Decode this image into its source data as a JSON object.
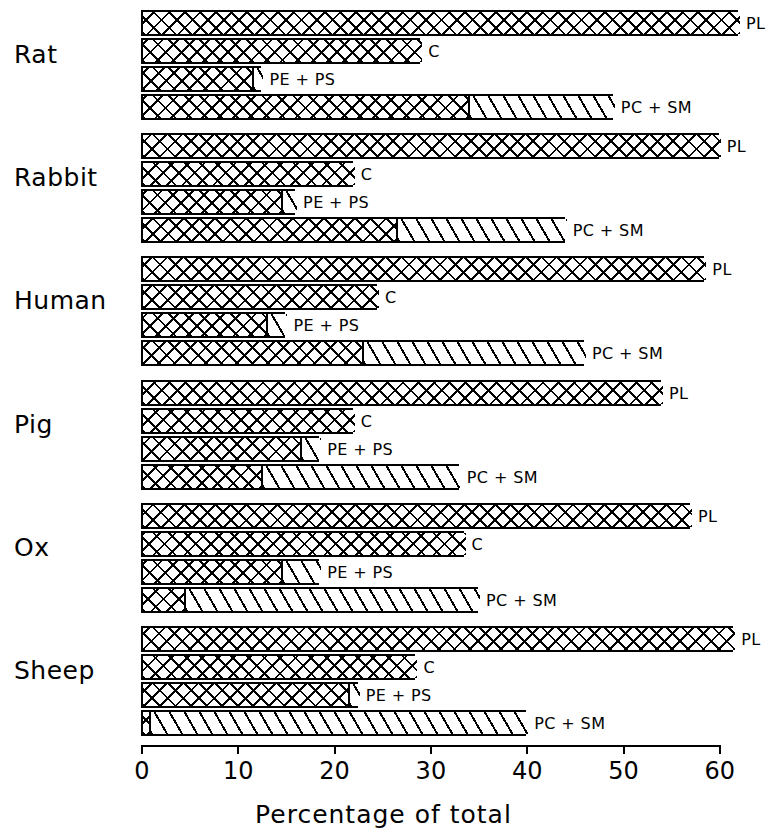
{
  "chart_data": {
    "type": "bar",
    "orientation": "horizontal",
    "title": "",
    "xlabel": "Percentage of total",
    "ylabel": "",
    "xlim": [
      0,
      62
    ],
    "xticks": [
      0,
      10,
      20,
      30,
      40,
      50,
      60
    ],
    "xticklabels": [
      "0",
      "10",
      "20",
      "30",
      "40",
      "50",
      "60"
    ],
    "grid": false,
    "legend": "inline-end-of-bar",
    "categories": [
      "Rat",
      "Rabbit",
      "Human",
      "Pig",
      "Ox",
      "Sheep"
    ],
    "series_names": [
      "PL",
      "C",
      "PE + PS",
      "PC + SM"
    ],
    "series": [
      {
        "name": "PL",
        "label": "PL",
        "values": [
          62.0,
          60.0,
          58.5,
          54.0,
          57.0,
          61.5
        ],
        "sub_values": [
          null,
          null,
          null,
          null,
          null,
          null
        ]
      },
      {
        "name": "C",
        "label": "C",
        "values": [
          29.0,
          22.0,
          24.5,
          22.0,
          33.5,
          28.5
        ],
        "sub_values": [
          null,
          null,
          null,
          null,
          null,
          null
        ]
      },
      {
        "name": "PE + PS",
        "label": "PE + PS",
        "values": [
          12.5,
          16.0,
          15.0,
          18.5,
          18.5,
          22.5
        ],
        "sub_values": [
          11.5,
          14.5,
          13.0,
          16.5,
          14.5,
          21.5
        ]
      },
      {
        "name": "PC + SM",
        "label": "PC + SM",
        "values": [
          49.0,
          44.0,
          46.0,
          33.0,
          35.0,
          40.0
        ],
        "sub_values": [
          34.0,
          26.5,
          23.0,
          12.5,
          4.5,
          0.8
        ]
      }
    ]
  },
  "axis": {
    "title": "Percentage of total",
    "ticks": [
      {
        "value": 0,
        "label": "0"
      },
      {
        "value": 10,
        "label": "10"
      },
      {
        "value": 20,
        "label": "20"
      },
      {
        "value": 30,
        "label": "30"
      },
      {
        "value": 40,
        "label": "40"
      },
      {
        "value": 50,
        "label": "50"
      },
      {
        "value": 60,
        "label": "60"
      }
    ]
  },
  "groups": [
    {
      "label": "Rat",
      "bars": [
        {
          "label": "PL",
          "total": 62.0,
          "cross": 62.0
        },
        {
          "label": "C",
          "total": 29.0,
          "cross": 29.0
        },
        {
          "label": "PE + PS",
          "total": 12.5,
          "cross": 11.5
        },
        {
          "label": "PC + SM",
          "total": 49.0,
          "cross": 34.0
        }
      ]
    },
    {
      "label": "Rabbit",
      "bars": [
        {
          "label": "PL",
          "total": 60.0,
          "cross": 60.0
        },
        {
          "label": "C",
          "total": 22.0,
          "cross": 22.0
        },
        {
          "label": "PE + PS",
          "total": 16.0,
          "cross": 14.5
        },
        {
          "label": "PC + SM",
          "total": 44.0,
          "cross": 26.5
        }
      ]
    },
    {
      "label": "Human",
      "bars": [
        {
          "label": "PL",
          "total": 58.5,
          "cross": 58.5
        },
        {
          "label": "C",
          "total": 24.5,
          "cross": 24.5
        },
        {
          "label": "PE + PS",
          "total": 15.0,
          "cross": 13.0
        },
        {
          "label": "PC + SM",
          "total": 46.0,
          "cross": 23.0
        }
      ]
    },
    {
      "label": "Pig",
      "bars": [
        {
          "label": "PL",
          "total": 54.0,
          "cross": 54.0
        },
        {
          "label": "C",
          "total": 22.0,
          "cross": 22.0
        },
        {
          "label": "PE + PS",
          "total": 18.5,
          "cross": 16.5
        },
        {
          "label": "PC + SM",
          "total": 33.0,
          "cross": 12.5
        }
      ]
    },
    {
      "label": "Ox",
      "bars": [
        {
          "label": "PL",
          "total": 57.0,
          "cross": 57.0
        },
        {
          "label": "C",
          "total": 33.5,
          "cross": 33.5
        },
        {
          "label": "PE + PS",
          "total": 18.5,
          "cross": 14.5
        },
        {
          "label": "PC + SM",
          "total": 35.0,
          "cross": 4.5
        }
      ]
    },
    {
      "label": "Sheep",
      "bars": [
        {
          "label": "PL",
          "total": 61.5,
          "cross": 61.5
        },
        {
          "label": "C",
          "total": 28.5,
          "cross": 28.5
        },
        {
          "label": "PE + PS",
          "total": 22.5,
          "cross": 21.5
        },
        {
          "label": "PC + SM",
          "total": 40.0,
          "cross": 0.8
        }
      ]
    }
  ],
  "geometry": {
    "origin_x": 141,
    "px_per_unit": 9.63,
    "group_tops": [
      10,
      133,
      256,
      380,
      503,
      626
    ],
    "group_label_offsets": [
      18,
      18,
      18,
      18,
      18,
      18
    ],
    "bar_row_offsets": [
      0,
      28,
      56,
      84
    ],
    "bar_height": 26,
    "axis_top": 745
  },
  "colors": {
    "ink": "#000000",
    "background": "#ffffff"
  }
}
